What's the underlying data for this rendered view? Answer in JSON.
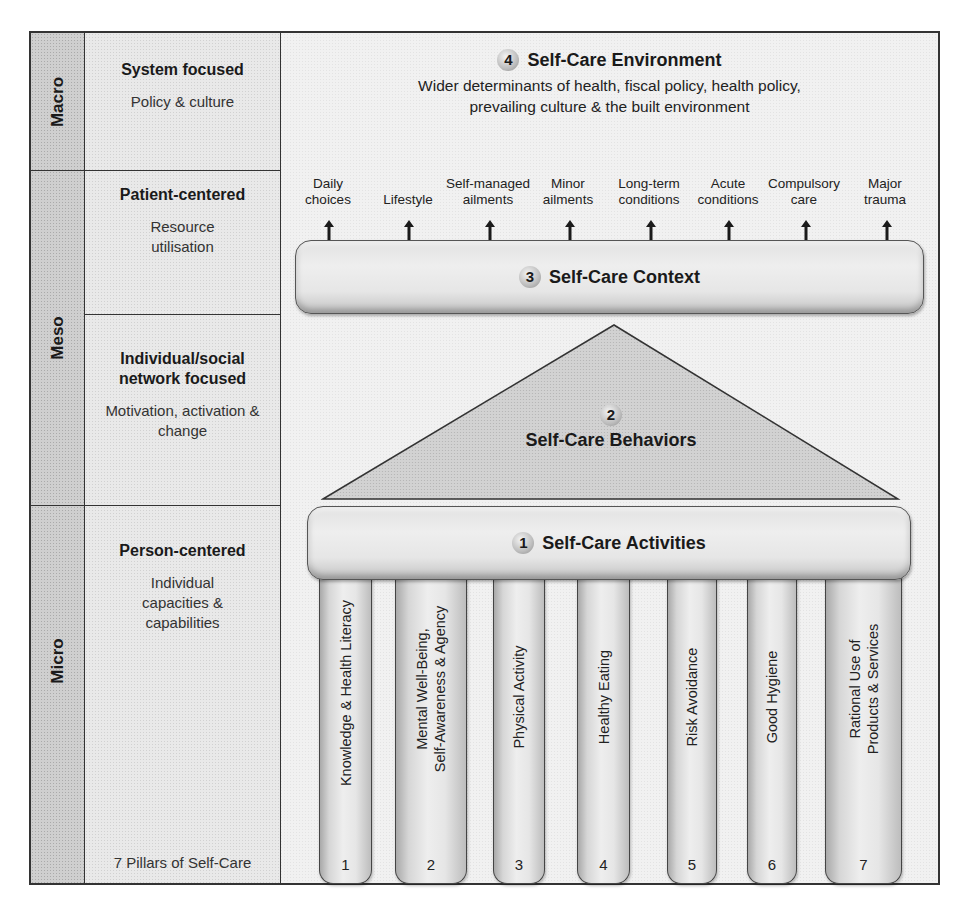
{
  "levels": [
    {
      "id": "macro",
      "label": "Macro"
    },
    {
      "id": "meso",
      "label": "Meso"
    },
    {
      "id": "micro",
      "label": "Micro"
    }
  ],
  "descriptors": [
    {
      "title": "System focused",
      "subtitle": "Policy & culture"
    },
    {
      "title": "Patient-centered",
      "subtitle": "Resource utilisation"
    },
    {
      "title": "Individual/social network focused",
      "subtitle": "Motivation, activation & change"
    },
    {
      "title": "Person-centered",
      "subtitle": "Individual capacities & capabilities"
    }
  ],
  "pillars_caption": "7 Pillars of Self-Care",
  "environment": {
    "number": "4",
    "title": "Self-Care Environment",
    "description_line1": "Wider determinants of health, fiscal policy, health policy,",
    "description_line2": "prevailing culture & the built environment"
  },
  "context_items": [
    {
      "line1": "Daily",
      "line2": "choices"
    },
    {
      "line1": "",
      "line2": "Lifestyle"
    },
    {
      "line1": "Self-managed",
      "line2": "ailments"
    },
    {
      "line1": "Minor",
      "line2": "ailments"
    },
    {
      "line1": "Long-term",
      "line2": "conditions"
    },
    {
      "line1": "Acute",
      "line2": "conditions"
    },
    {
      "line1": "Compulsory",
      "line2": "care"
    },
    {
      "line1": "Major",
      "line2": "trauma"
    }
  ],
  "context": {
    "number": "3",
    "title": "Self-Care Context"
  },
  "behaviors": {
    "number": "2",
    "title": "Self-Care Behaviors"
  },
  "activities": {
    "number": "1",
    "title": "Self-Care Activities"
  },
  "pillars": [
    {
      "number": "1",
      "line1": "Knowledge & Health Literacy",
      "line2": ""
    },
    {
      "number": "2",
      "line1": "Mental Well-Being,",
      "line2": "Self-Awareness & Agency"
    },
    {
      "number": "3",
      "line1": "Physical Activity",
      "line2": ""
    },
    {
      "number": "4",
      "line1": "Healthy Eating",
      "line2": ""
    },
    {
      "number": "5",
      "line1": "Risk Avoidance",
      "line2": ""
    },
    {
      "number": "6",
      "line1": "Good Hygiene",
      "line2": ""
    },
    {
      "number": "7",
      "line1": "Rational Use of",
      "line2": "Products & Services"
    }
  ],
  "colors": {
    "frame": "#333333",
    "level_fill": "#cfcfcf",
    "panel_fill": "#e9e9e9",
    "text": "#1a1a1a"
  }
}
